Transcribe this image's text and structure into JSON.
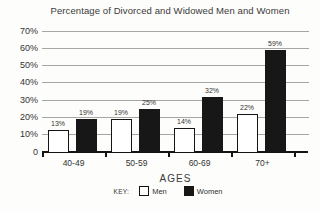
{
  "title": "Percentage of Divorced and Widowed Men and Women",
  "chart_data": {
    "type": "bar",
    "categories": [
      "40-49",
      "50-59",
      "60-69",
      "70+"
    ],
    "series": [
      {
        "name": "Men",
        "values": [
          13,
          19,
          14,
          22
        ]
      },
      {
        "name": "Women",
        "values": [
          19,
          25,
          32,
          59
        ]
      }
    ],
    "value_labels": {
      "Men": [
        "13%",
        "19%",
        "14%",
        "22%"
      ],
      "Women": [
        "19%",
        "25%",
        "32%",
        "59%"
      ]
    },
    "xlabel": "AGES",
    "ylim": [
      0,
      70
    ],
    "ytick_step": 10,
    "ytick_labels": [
      "0",
      "10%",
      "20%",
      "30%",
      "40%",
      "50%",
      "60%",
      "70%"
    ],
    "grid": true,
    "legend": {
      "prefix": "KEY:",
      "entries": [
        "Men",
        "Women"
      ],
      "position": "bottom"
    }
  },
  "colors": {
    "background": "#fdfdfb",
    "men_bar_fill": "#ffffff",
    "women_bar_fill": "#171717",
    "bar_border": "#141414",
    "gridline": "#a6a6a2",
    "text": "#333333"
  }
}
